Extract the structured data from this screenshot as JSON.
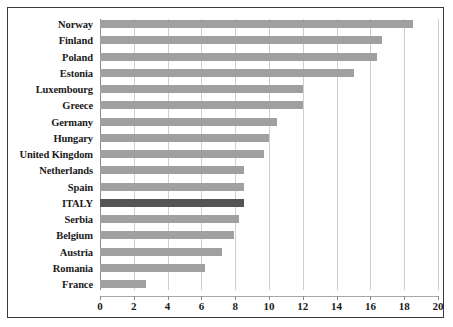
{
  "chart_data": {
    "type": "bar",
    "orientation": "horizontal",
    "title": "",
    "xlabel": "",
    "ylabel": "",
    "xlim": [
      0,
      20
    ],
    "xticks": [
      0,
      2,
      4,
      6,
      8,
      10,
      12,
      14,
      16,
      18,
      20
    ],
    "grid": true,
    "legend": false,
    "categories": [
      "Norway",
      "Finland",
      "Poland",
      "Estonia",
      "Luxembourg",
      "Greece",
      "Germany",
      "Hungary",
      "United Kingdom",
      "Netherlands",
      "Spain",
      "ITALY",
      "Serbia",
      "Belgium",
      "Austria",
      "Romania",
      "France"
    ],
    "values": [
      18.5,
      16.7,
      16.4,
      15.0,
      12.0,
      12.0,
      10.5,
      10.0,
      9.7,
      8.5,
      8.5,
      8.5,
      8.2,
      7.9,
      7.2,
      6.2,
      2.7
    ],
    "highlight_category": "ITALY",
    "colors": {
      "bar": "#a0a0a0",
      "bar_highlight": "#555555",
      "gridline": "#cfcfcf",
      "axis": "#8c8c8c",
      "border": "#3a3a3a",
      "text": "#1a1a1a",
      "background": "#ffffff"
    }
  }
}
